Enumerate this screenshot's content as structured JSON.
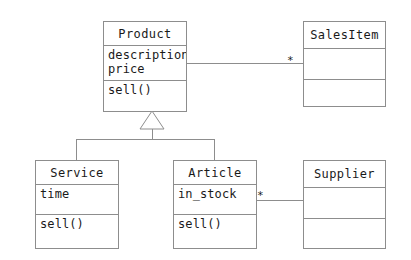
{
  "diagram": {
    "notation": "UML",
    "background_color": "#ffffff",
    "line_color": "#8d8d8d",
    "text_color": "#1a1a1a"
  },
  "classes": {
    "product": {
      "name": "Product",
      "attributes": [
        "description",
        "price"
      ],
      "operations": [
        "sell()"
      ]
    },
    "sales_item": {
      "name": "SalesItem",
      "attributes": [],
      "operations": []
    },
    "service": {
      "name": "Service",
      "attributes": [
        "time"
      ],
      "operations": [
        "sell()"
      ]
    },
    "article": {
      "name": "Article",
      "attributes": [
        "in_stock"
      ],
      "operations": [
        "sell()"
      ]
    },
    "supplier": {
      "name": "Supplier",
      "attributes": [],
      "operations": []
    }
  },
  "relationships": {
    "product_salesitem": {
      "type": "association",
      "source": "Product",
      "target": "SalesItem",
      "target_multiplicity": "*"
    },
    "article_supplier": {
      "type": "association",
      "source": "Article",
      "target": "Supplier",
      "source_multiplicity": "*"
    },
    "generalization": {
      "type": "generalization",
      "parent": "Product",
      "children": [
        "Service",
        "Article"
      ]
    }
  }
}
